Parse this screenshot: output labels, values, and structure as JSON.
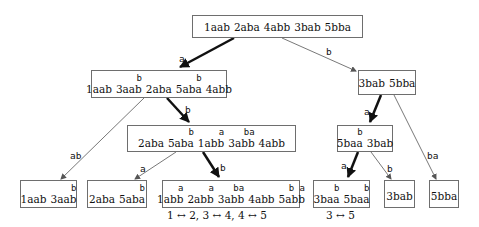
{
  "nodes": {
    "root": {
      "tokens": [
        {
          "w": "1aab",
          "sup": ""
        },
        {
          "w": "2aba",
          "sup": ""
        },
        {
          "w": "4abb",
          "sup": ""
        },
        {
          "w": "3bab",
          "sup": ""
        },
        {
          "w": "5bba",
          "sup": ""
        }
      ]
    },
    "l1_left": {
      "tokens": [
        {
          "w": "1aab",
          "sup": ""
        },
        {
          "w": "3aab",
          "sup": "b"
        },
        {
          "w": "2aba",
          "sup": ""
        },
        {
          "w": "5aba",
          "sup": "b"
        },
        {
          "w": "4abb",
          "sup": ""
        }
      ]
    },
    "l1_right": {
      "tokens": [
        {
          "w": "3bab",
          "sup": ""
        },
        {
          "w": "5bba",
          "sup": ""
        }
      ]
    },
    "l2_mid": {
      "tokens": [
        {
          "w": "2aba",
          "sup": ""
        },
        {
          "w": "5aba",
          "sup": "b"
        },
        {
          "w": "1abb",
          "sup": "a"
        },
        {
          "w": "3abb",
          "sup": "ba"
        },
        {
          "w": "4abb",
          "sup": ""
        }
      ]
    },
    "l2_right": {
      "tokens": [
        {
          "w": "5baa",
          "sup": "b"
        },
        {
          "w": "3bab",
          "sup": ""
        }
      ]
    },
    "leaf1": {
      "tokens": [
        {
          "w": "1aab",
          "sup": ""
        },
        {
          "w": "3aab",
          "sup": "b"
        }
      ]
    },
    "leaf2": {
      "tokens": [
        {
          "w": "2aba",
          "sup": ""
        },
        {
          "w": "5aba",
          "sup": "b"
        }
      ]
    },
    "leaf3": {
      "tokens": [
        {
          "w": "1abb",
          "sup": "a"
        },
        {
          "w": "2abb",
          "sup": "a"
        },
        {
          "w": "3abb",
          "sup": "ba"
        },
        {
          "w": "4abb",
          "sup": ""
        },
        {
          "w": "5abb",
          "sup": "b a"
        }
      ]
    },
    "leaf4": {
      "tokens": [
        {
          "w": "3baa",
          "sup": "b"
        },
        {
          "w": "5baa",
          "sup": "b"
        }
      ]
    },
    "leaf5": {
      "tokens": [
        {
          "w": "3bab",
          "sup": ""
        }
      ]
    },
    "leaf6": {
      "tokens": [
        {
          "w": "5bba",
          "sup": ""
        }
      ]
    }
  },
  "edges": [
    {
      "id": "root-l1left",
      "label": "a",
      "bold": true
    },
    {
      "id": "root-l1right",
      "label": "b",
      "bold": false
    },
    {
      "id": "l1left-l2mid",
      "label": "b",
      "bold": true
    },
    {
      "id": "l1left-leaf1",
      "label": "ab",
      "bold": false
    },
    {
      "id": "l2mid-leaf2",
      "label": "a",
      "bold": false
    },
    {
      "id": "l2mid-leaf3",
      "label": "b",
      "bold": true
    },
    {
      "id": "l1right-l2right",
      "label": "a",
      "bold": true
    },
    {
      "id": "l1right-leaf6",
      "label": "ba",
      "bold": false
    },
    {
      "id": "l2right-leaf4",
      "label": "a",
      "bold": true
    },
    {
      "id": "l2right-leaf5",
      "label": "b",
      "bold": false
    }
  ],
  "swaps": {
    "leaf3": "1 ↔ 2,     3 ↔ 4,     4 ↔ 5",
    "leaf4": "3 ↔ 5"
  },
  "colors": {
    "line": "#6e6e6e",
    "bold_line": "#111111",
    "text": "#111111"
  }
}
